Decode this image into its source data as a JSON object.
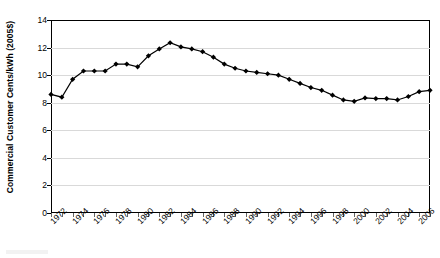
{
  "chart_data": {
    "type": "line",
    "title": "",
    "xlabel": "",
    "ylabel": "Commercial Customer Cents/kWh (2005$)",
    "ylim": [
      0,
      14
    ],
    "ytick_labels": [
      "0",
      "2",
      "4",
      "6",
      "8",
      "10",
      "12",
      "14"
    ],
    "ytick_values": [
      0,
      2,
      4,
      6,
      8,
      10,
      12,
      14
    ],
    "xlim": [
      1972,
      2007
    ],
    "xtick_labels": [
      "1972",
      "1974",
      "1976",
      "1978",
      "1980",
      "1982",
      "1984",
      "1986",
      "1988",
      "1990",
      "1992",
      "1994",
      "1996",
      "1998",
      "2000",
      "2002",
      "2004",
      "2006"
    ],
    "grid": "horizontal",
    "legend": "none",
    "marker": "diamond",
    "line_color": "#000000",
    "marker_color": "#000000",
    "gridline_color": "#d9d9d9",
    "x": [
      1972,
      1973,
      1974,
      1975,
      1976,
      1977,
      1978,
      1979,
      1980,
      1981,
      1982,
      1983,
      1984,
      1985,
      1986,
      1987,
      1988,
      1989,
      1990,
      1991,
      1992,
      1993,
      1994,
      1995,
      1996,
      1997,
      1998,
      1999,
      2000,
      2001,
      2002,
      2003,
      2004,
      2005,
      2006,
      2007
    ],
    "values": [
      8.6,
      8.4,
      9.7,
      10.3,
      10.3,
      10.3,
      10.8,
      10.8,
      10.6,
      11.4,
      11.9,
      12.35,
      12.05,
      11.9,
      11.7,
      11.3,
      10.8,
      10.5,
      10.3,
      10.2,
      10.1,
      10.0,
      9.7,
      9.4,
      9.1,
      8.9,
      8.55,
      8.2,
      8.1,
      8.35,
      8.3,
      8.3,
      8.2,
      8.45,
      8.8,
      8.9
    ]
  },
  "yaxis": {
    "label": "Commercial Customer Cents/kWh (2005$)"
  }
}
